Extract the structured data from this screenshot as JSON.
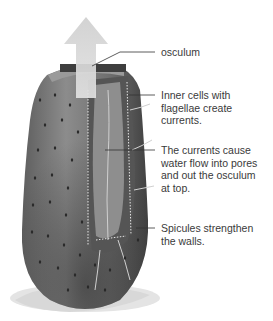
{
  "diagram": {
    "labels": [
      {
        "id": "osculum",
        "text": "osculum",
        "lines": [
          "osculum"
        ]
      },
      {
        "id": "inner-cells",
        "text": "Inner cells with flagellae create currents.",
        "lines": [
          "Inner cells with",
          "flagellae create",
          "currents."
        ]
      },
      {
        "id": "currents",
        "text": "The currents cause water flow into pores and out the osculum at top.",
        "lines": [
          "The currents cause",
          "water flow into pores",
          "and out the osculum",
          "at top."
        ]
      },
      {
        "id": "spicules",
        "text": "Spicules strengthen the walls.",
        "lines": [
          "Spicules strengthen",
          "the walls."
        ]
      }
    ],
    "arrow": {
      "direction": "up",
      "meaning": "water flow out of osculum"
    },
    "colors": {
      "body": "#7a7a7a",
      "body_dark": "#3c3c3c",
      "arrow": "#d6d6d6",
      "leader_line": "#333333",
      "text": "#3a3a3a"
    }
  }
}
